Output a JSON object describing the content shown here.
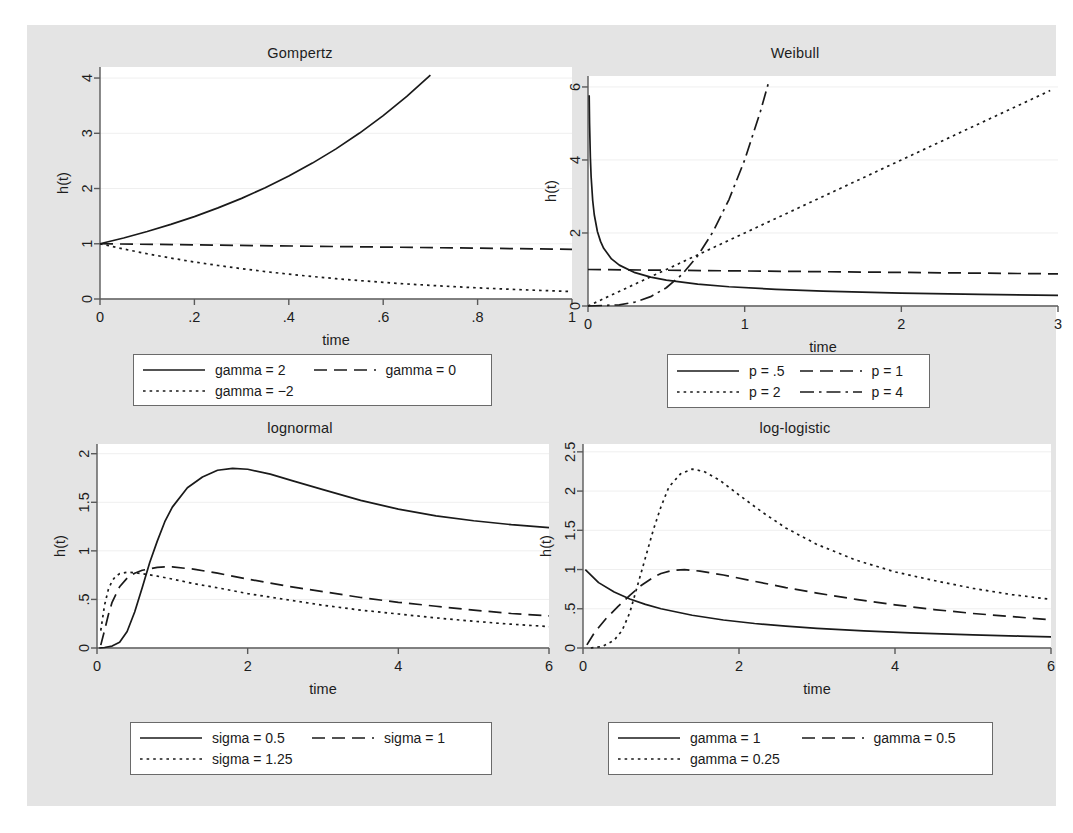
{
  "figure": {
    "background_color": "#e4e4e4",
    "plot_background_color": "#ffffff",
    "line_color": "#1a1a1a",
    "grid_color": "#efefef"
  },
  "chart_data": [
    {
      "id": "gompertz",
      "type": "line",
      "title": "Gompertz",
      "xlabel": "time",
      "ylabel": "h(t)",
      "xlim": [
        0,
        1
      ],
      "ylim": [
        0,
        4.2
      ],
      "xticks": [
        0,
        0.2,
        0.4,
        0.6,
        0.8,
        1
      ],
      "xticklabels": [
        "0",
        ".2",
        ".4",
        ".6",
        ".8",
        "1"
      ],
      "yticks": [
        0,
        1,
        2,
        3,
        4
      ],
      "yticklabels": [
        "0",
        "1",
        "2",
        "3",
        "4"
      ],
      "grid": true,
      "legend_position": "below",
      "series": [
        {
          "name": "gamma = 2",
          "dash": "solid",
          "gamma": 2,
          "t_max": 0.7
        },
        {
          "name": "gamma = 0",
          "dash": "dashed",
          "gamma": 0,
          "t_max": 1
        },
        {
          "name": "gamma = -2",
          "dash": "dotted",
          "gamma": -2,
          "t_max": 1
        }
      ],
      "formula": "h(t) = exp(gamma * t)",
      "points": {
        "gamma = 2": [
          [
            0,
            1
          ],
          [
            0.05,
            1.105
          ],
          [
            0.1,
            1.221
          ],
          [
            0.15,
            1.35
          ],
          [
            0.2,
            1.492
          ],
          [
            0.25,
            1.649
          ],
          [
            0.3,
            1.822
          ],
          [
            0.35,
            2.014
          ],
          [
            0.4,
            2.226
          ],
          [
            0.45,
            2.46
          ],
          [
            0.5,
            2.718
          ],
          [
            0.55,
            3.004
          ],
          [
            0.6,
            3.32
          ],
          [
            0.65,
            3.669
          ],
          [
            0.7,
            4.055
          ]
        ],
        "gamma = 0": [
          [
            0,
            1
          ],
          [
            0.25,
            0.975
          ],
          [
            0.5,
            0.95
          ],
          [
            0.75,
            0.925
          ],
          [
            1,
            0.9
          ]
        ],
        "gamma = -2": [
          [
            0,
            1
          ],
          [
            0.05,
            0.905
          ],
          [
            0.1,
            0.819
          ],
          [
            0.15,
            0.741
          ],
          [
            0.2,
            0.67
          ],
          [
            0.25,
            0.607
          ],
          [
            0.3,
            0.549
          ],
          [
            0.35,
            0.497
          ],
          [
            0.4,
            0.449
          ],
          [
            0.45,
            0.407
          ],
          [
            0.5,
            0.368
          ],
          [
            0.55,
            0.333
          ],
          [
            0.6,
            0.301
          ],
          [
            0.65,
            0.272
          ],
          [
            0.7,
            0.247
          ],
          [
            0.75,
            0.223
          ],
          [
            0.8,
            0.202
          ],
          [
            0.85,
            0.183
          ],
          [
            0.9,
            0.165
          ],
          [
            0.95,
            0.15
          ],
          [
            1,
            0.135
          ]
        ]
      }
    },
    {
      "id": "weibull",
      "type": "line",
      "title": "Weibull",
      "xlabel": "time",
      "ylabel": "h(t)",
      "xlim": [
        0,
        3
      ],
      "ylim": [
        0,
        6.3
      ],
      "xticks": [
        0,
        1,
        2,
        3
      ],
      "xticklabels": [
        "0",
        "1",
        "2",
        "3"
      ],
      "yticks": [
        0,
        2,
        4,
        6
      ],
      "yticklabels": [
        "0",
        "2",
        "4",
        "6"
      ],
      "grid": true,
      "legend_position": "below",
      "series": [
        {
          "name": "p = .5",
          "dash": "solid",
          "p": 0.5
        },
        {
          "name": "p = 1",
          "dash": "dashed",
          "p": 1
        },
        {
          "name": "p = 2",
          "dash": "dotted",
          "p": 2
        },
        {
          "name": "p = 4",
          "dash": "dashdot",
          "p": 4
        }
      ],
      "formula": "h(t) = p * t^(p-1)",
      "points": {
        "p = .5": [
          [
            0.0075,
            5.77
          ],
          [
            0.01,
            5.0
          ],
          [
            0.015,
            4.08
          ],
          [
            0.02,
            3.54
          ],
          [
            0.03,
            2.89
          ],
          [
            0.04,
            2.5
          ],
          [
            0.06,
            2.04
          ],
          [
            0.08,
            1.77
          ],
          [
            0.1,
            1.58
          ],
          [
            0.15,
            1.29
          ],
          [
            0.2,
            1.12
          ],
          [
            0.3,
            0.913
          ],
          [
            0.4,
            0.79
          ],
          [
            0.5,
            0.707
          ],
          [
            0.7,
            0.598
          ],
          [
            0.9,
            0.527
          ],
          [
            1.2,
            0.456
          ],
          [
            1.5,
            0.408
          ],
          [
            2,
            0.354
          ],
          [
            2.5,
            0.316
          ],
          [
            3,
            0.289
          ]
        ],
        "p = 1": [
          [
            0,
            1
          ],
          [
            1,
            0.96
          ],
          [
            2,
            0.92
          ],
          [
            3,
            0.88
          ]
        ],
        "p = 2": [
          [
            0,
            0
          ],
          [
            0.25,
            0.5
          ],
          [
            0.5,
            1
          ],
          [
            0.75,
            1.5
          ],
          [
            1,
            2
          ],
          [
            1.5,
            3
          ],
          [
            2,
            4
          ],
          [
            2.5,
            5
          ],
          [
            2.95,
            5.9
          ]
        ],
        "p = 4": [
          [
            0,
            0
          ],
          [
            0.2,
            0.032
          ],
          [
            0.3,
            0.108
          ],
          [
            0.4,
            0.256
          ],
          [
            0.5,
            0.5
          ],
          [
            0.6,
            0.864
          ],
          [
            0.7,
            1.372
          ],
          [
            0.8,
            2.048
          ],
          [
            0.9,
            2.916
          ],
          [
            1,
            4
          ],
          [
            1.1,
            5.32
          ],
          [
            1.15,
            6.08
          ]
        ]
      }
    },
    {
      "id": "lognormal",
      "type": "line",
      "title": "lognormal",
      "xlabel": "time",
      "ylabel": "h(t)",
      "xlim": [
        0,
        6
      ],
      "ylim": [
        0,
        2.1
      ],
      "xticks": [
        0,
        2,
        4,
        6
      ],
      "xticklabels": [
        "0",
        "2",
        "4",
        "6"
      ],
      "yticks": [
        0,
        0.5,
        1,
        1.5,
        2
      ],
      "yticklabels": [
        "0",
        ".5",
        "1",
        "1.5",
        "2"
      ],
      "grid": true,
      "legend_position": "below",
      "series": [
        {
          "name": "sigma = 0.5",
          "dash": "solid",
          "sigma": 0.5
        },
        {
          "name": "sigma = 1",
          "dash": "dashed",
          "sigma": 1
        },
        {
          "name": "sigma = 1.25",
          "dash": "dotted",
          "sigma": 1.25
        }
      ],
      "points": {
        "sigma = 0.5": [
          [
            0.03,
            0.0
          ],
          [
            0.1,
            0.005
          ],
          [
            0.2,
            0.02
          ],
          [
            0.3,
            0.06
          ],
          [
            0.4,
            0.17
          ],
          [
            0.5,
            0.37
          ],
          [
            0.6,
            0.62
          ],
          [
            0.7,
            0.88
          ],
          [
            0.8,
            1.1
          ],
          [
            0.9,
            1.3
          ],
          [
            1.0,
            1.45
          ],
          [
            1.2,
            1.65
          ],
          [
            1.4,
            1.76
          ],
          [
            1.6,
            1.83
          ],
          [
            1.8,
            1.85
          ],
          [
            2.0,
            1.84
          ],
          [
            2.3,
            1.79
          ],
          [
            2.6,
            1.72
          ],
          [
            3.0,
            1.63
          ],
          [
            3.5,
            1.52
          ],
          [
            4.0,
            1.43
          ],
          [
            4.5,
            1.36
          ],
          [
            5.0,
            1.31
          ],
          [
            5.5,
            1.27
          ],
          [
            6.0,
            1.24
          ]
        ],
        "sigma = 1": [
          [
            0.05,
            0.03
          ],
          [
            0.1,
            0.18
          ],
          [
            0.15,
            0.34
          ],
          [
            0.2,
            0.47
          ],
          [
            0.3,
            0.63
          ],
          [
            0.4,
            0.72
          ],
          [
            0.5,
            0.77
          ],
          [
            0.6,
            0.8
          ],
          [
            0.7,
            0.815
          ],
          [
            0.8,
            0.83
          ],
          [
            0.9,
            0.835
          ],
          [
            1.0,
            0.835
          ],
          [
            1.3,
            0.81
          ],
          [
            1.6,
            0.77
          ],
          [
            2.0,
            0.71
          ],
          [
            2.5,
            0.64
          ],
          [
            3.0,
            0.58
          ],
          [
            3.5,
            0.52
          ],
          [
            4.0,
            0.47
          ],
          [
            4.5,
            0.43
          ],
          [
            5.0,
            0.39
          ],
          [
            5.5,
            0.355
          ],
          [
            6.0,
            0.33
          ]
        ],
        "sigma = 1.25": [
          [
            0.05,
            0.18
          ],
          [
            0.1,
            0.44
          ],
          [
            0.15,
            0.6
          ],
          [
            0.2,
            0.69
          ],
          [
            0.25,
            0.74
          ],
          [
            0.3,
            0.765
          ],
          [
            0.4,
            0.78
          ],
          [
            0.5,
            0.775
          ],
          [
            0.6,
            0.765
          ],
          [
            0.8,
            0.74
          ],
          [
            1.0,
            0.71
          ],
          [
            1.3,
            0.66
          ],
          [
            1.6,
            0.62
          ],
          [
            2.0,
            0.56
          ],
          [
            2.5,
            0.5
          ],
          [
            3.0,
            0.44
          ],
          [
            3.5,
            0.39
          ],
          [
            4.0,
            0.35
          ],
          [
            4.5,
            0.31
          ],
          [
            5.0,
            0.275
          ],
          [
            5.5,
            0.245
          ],
          [
            6.0,
            0.22
          ]
        ]
      }
    },
    {
      "id": "log-logistic",
      "type": "line",
      "title": "log-logistic",
      "xlabel": "time",
      "ylabel": "h(t)",
      "xlim": [
        0,
        6
      ],
      "ylim": [
        0,
        2.6
      ],
      "xticks": [
        0,
        2,
        4,
        6
      ],
      "xticklabels": [
        "0",
        "2",
        "4",
        "6"
      ],
      "yticks": [
        0,
        0.5,
        1,
        1.5,
        2,
        2.5
      ],
      "yticklabels": [
        "0",
        ".5",
        "1",
        "1.5",
        "2",
        "2.5"
      ],
      "grid": true,
      "legend_position": "below",
      "series": [
        {
          "name": "gamma = 1",
          "dash": "solid",
          "gamma": 1
        },
        {
          "name": "gamma = 0.5",
          "dash": "dashed",
          "gamma": 0.5
        },
        {
          "name": "gamma = 0.25",
          "dash": "dotted",
          "gamma": 0.25
        }
      ],
      "points": {
        "gamma = 1": [
          [
            0.03,
            1.0
          ],
          [
            0.2,
            0.833
          ],
          [
            0.4,
            0.714
          ],
          [
            0.6,
            0.625
          ],
          [
            0.8,
            0.556
          ],
          [
            1.0,
            0.5
          ],
          [
            1.4,
            0.417
          ],
          [
            1.8,
            0.357
          ],
          [
            2.2,
            0.312
          ],
          [
            2.6,
            0.278
          ],
          [
            3.0,
            0.25
          ],
          [
            3.6,
            0.217
          ],
          [
            4.2,
            0.192
          ],
          [
            5.0,
            0.167
          ],
          [
            5.6,
            0.152
          ],
          [
            6.0,
            0.143
          ]
        ],
        "gamma = 0.5": [
          [
            0.05,
            0.04
          ],
          [
            0.15,
            0.2
          ],
          [
            0.3,
            0.38
          ],
          [
            0.45,
            0.53
          ],
          [
            0.6,
            0.67
          ],
          [
            0.75,
            0.8
          ],
          [
            0.9,
            0.9
          ],
          [
            1.0,
            0.95
          ],
          [
            1.15,
            0.99
          ],
          [
            1.3,
            1.0
          ],
          [
            1.5,
            0.98
          ],
          [
            1.8,
            0.93
          ],
          [
            2.2,
            0.85
          ],
          [
            2.6,
            0.77
          ],
          [
            3.0,
            0.7
          ],
          [
            3.5,
            0.62
          ],
          [
            4.0,
            0.55
          ],
          [
            4.5,
            0.49
          ],
          [
            5.0,
            0.44
          ],
          [
            5.5,
            0.4
          ],
          [
            6.0,
            0.36
          ]
        ],
        "gamma = 0.25": [
          [
            0.1,
            0.0
          ],
          [
            0.25,
            0.02
          ],
          [
            0.4,
            0.1
          ],
          [
            0.5,
            0.22
          ],
          [
            0.6,
            0.45
          ],
          [
            0.7,
            0.8
          ],
          [
            0.8,
            1.15
          ],
          [
            0.9,
            1.5
          ],
          [
            1.0,
            1.8
          ],
          [
            1.1,
            2.05
          ],
          [
            1.25,
            2.22
          ],
          [
            1.4,
            2.28
          ],
          [
            1.55,
            2.25
          ],
          [
            1.75,
            2.14
          ],
          [
            2.0,
            1.95
          ],
          [
            2.3,
            1.73
          ],
          [
            2.6,
            1.53
          ],
          [
            3.0,
            1.32
          ],
          [
            3.5,
            1.12
          ],
          [
            4.0,
            0.97
          ],
          [
            4.5,
            0.86
          ],
          [
            5.0,
            0.76
          ],
          [
            5.5,
            0.68
          ],
          [
            6.0,
            0.62
          ]
        ]
      }
    }
  ],
  "legends": [
    {
      "id": "legend-gompertz",
      "entries": [
        {
          "label": "gamma = 2",
          "dash": "solid"
        },
        {
          "label": "gamma = 0",
          "dash": "dashed"
        },
        {
          "label": "gamma = −2",
          "dash": "dotted"
        }
      ]
    },
    {
      "id": "legend-weibull",
      "entries": [
        {
          "label": "p = .5",
          "dash": "solid"
        },
        {
          "label": "p = 1",
          "dash": "dashed"
        },
        {
          "label": "p = 2",
          "dash": "dotted"
        },
        {
          "label": "p = 4",
          "dash": "dashdot"
        }
      ]
    },
    {
      "id": "legend-lognormal",
      "entries": [
        {
          "label": "sigma = 0.5",
          "dash": "solid"
        },
        {
          "label": "sigma = 1",
          "dash": "dashed"
        },
        {
          "label": "sigma = 1.25",
          "dash": "dotted"
        }
      ]
    },
    {
      "id": "legend-loglogistic",
      "entries": [
        {
          "label": "gamma = 1",
          "dash": "solid"
        },
        {
          "label": "gamma = 0.5",
          "dash": "dashed"
        },
        {
          "label": "gamma = 0.25",
          "dash": "dotted"
        }
      ]
    }
  ]
}
